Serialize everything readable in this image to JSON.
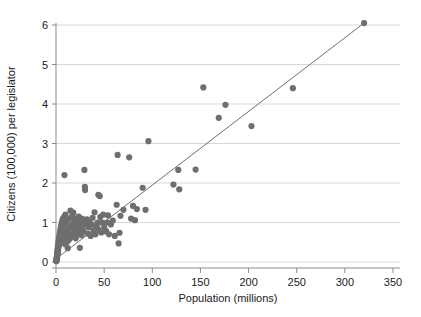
{
  "chart_data": {
    "type": "scatter",
    "title": "",
    "subtitle": "",
    "xlabel": "Population (millions)",
    "ylabel": "Citizens (100,000) per legislator",
    "xlim": [
      -8,
      358
    ],
    "ylim": [
      -0.18,
      6.35
    ],
    "xticks": [
      0,
      50,
      100,
      150,
      200,
      250,
      300,
      350
    ],
    "yticks": [
      0,
      1,
      2,
      3,
      4,
      5,
      6
    ],
    "xtick_labels": [
      "0",
      "50",
      "100",
      "150",
      "200",
      "250",
      "300",
      "350"
    ],
    "ytick_labels": [
      "0",
      "1",
      "2",
      "3",
      "4",
      "5",
      "6"
    ],
    "grid": "horizontal",
    "legend": "none",
    "annotations": [],
    "colors": {
      "marker": "#6e6e6e",
      "fit_line": "#6e6e6e",
      "gridline": "#d8d8d8",
      "axis": "#8a8a8a",
      "text": "#1a1a1a",
      "background": "#ffffff"
    },
    "marker_size_px": 3.1,
    "series": [
      {
        "name": "Countries",
        "type": "scatter",
        "points": [
          [
            0.3,
            0.02
          ],
          [
            0.4,
            0.05
          ],
          [
            0.5,
            0.03
          ],
          [
            0.6,
            0.08
          ],
          [
            0.7,
            0.06
          ],
          [
            0.8,
            0.12
          ],
          [
            0.9,
            0.1
          ],
          [
            1.0,
            0.15
          ],
          [
            1.1,
            0.09
          ],
          [
            1.2,
            0.2
          ],
          [
            1.3,
            0.14
          ],
          [
            1.4,
            0.25
          ],
          [
            1.5,
            0.18
          ],
          [
            1.6,
            0.3
          ],
          [
            1.7,
            0.22
          ],
          [
            1.8,
            0.35
          ],
          [
            1.9,
            0.26
          ],
          [
            2.0,
            0.4
          ],
          [
            2.1,
            0.3
          ],
          [
            2.2,
            0.45
          ],
          [
            2.3,
            0.33
          ],
          [
            2.5,
            0.5
          ],
          [
            2.6,
            0.38
          ],
          [
            2.8,
            0.55
          ],
          [
            3.0,
            0.42
          ],
          [
            3.1,
            0.6
          ],
          [
            3.3,
            0.47
          ],
          [
            3.5,
            0.65
          ],
          [
            3.6,
            0.5
          ],
          [
            3.8,
            0.7
          ],
          [
            4.0,
            0.55
          ],
          [
            4.1,
            0.75
          ],
          [
            4.3,
            0.58
          ],
          [
            4.5,
            0.8
          ],
          [
            4.7,
            0.62
          ],
          [
            4.9,
            0.85
          ],
          [
            5.1,
            0.66
          ],
          [
            5.3,
            0.9
          ],
          [
            5.5,
            0.7
          ],
          [
            5.7,
            0.95
          ],
          [
            5.9,
            0.74
          ],
          [
            6.1,
            1.0
          ],
          [
            6.3,
            0.78
          ],
          [
            6.6,
            1.05
          ],
          [
            6.9,
            0.82
          ],
          [
            7.2,
            1.1
          ],
          [
            7.4,
            0.86
          ],
          [
            7.7,
            0.55
          ],
          [
            8.0,
            0.9
          ],
          [
            8.3,
            0.6
          ],
          [
            8.6,
            1.15
          ],
          [
            8.9,
            0.65
          ],
          [
            9.2,
            0.95
          ],
          [
            9.5,
            0.45
          ],
          [
            9.8,
            1.2
          ],
          [
            8.8,
            2.2
          ],
          [
            10.2,
            0.7
          ],
          [
            10.6,
            1.0
          ],
          [
            11.0,
            0.5
          ],
          [
            11.4,
            0.75
          ],
          [
            11.8,
            1.05
          ],
          [
            12.2,
            0.35
          ],
          [
            12.6,
            0.8
          ],
          [
            13.0,
            0.55
          ],
          [
            13.5,
            1.1
          ],
          [
            14.0,
            0.85
          ],
          [
            14.5,
            0.6
          ],
          [
            15.0,
            1.3
          ],
          [
            15.5,
            0.9
          ],
          [
            16.0,
            0.65
          ],
          [
            16.5,
            1.15
          ],
          [
            17.0,
            0.95
          ],
          [
            17.5,
            0.7
          ],
          [
            18.0,
            1.25
          ],
          [
            18.5,
            1.0
          ],
          [
            19.0,
            0.75
          ],
          [
            19.5,
            1.05
          ],
          [
            20.0,
            0.85
          ],
          [
            20.5,
            0.6
          ],
          [
            21.0,
            1.1
          ],
          [
            21.5,
            0.9
          ],
          [
            22.0,
            0.7
          ],
          [
            22.5,
            1.0
          ],
          [
            23.0,
            0.8
          ],
          [
            23.5,
            1.15
          ],
          [
            24.0,
            0.95
          ],
          [
            24.5,
            0.75
          ],
          [
            25.0,
            1.05
          ],
          [
            25.5,
            0.85
          ],
          [
            26.0,
            1.0
          ],
          [
            26.5,
            0.68
          ],
          [
            27.0,
            1.1
          ],
          [
            27.5,
            0.88
          ],
          [
            28.0,
            0.98
          ],
          [
            28.5,
            0.78
          ],
          [
            24.8,
            0.36
          ],
          [
            29.5,
            2.33
          ],
          [
            29.0,
            1.02
          ],
          [
            30.0,
            1.9
          ],
          [
            30.2,
            1.82
          ],
          [
            31.0,
            0.95
          ],
          [
            32.0,
            1.08
          ],
          [
            33.0,
            0.72
          ],
          [
            34.0,
            0.88
          ],
          [
            35.0,
            1.0
          ],
          [
            36.0,
            0.66
          ],
          [
            37.0,
            0.95
          ],
          [
            38.0,
            1.12
          ],
          [
            39.0,
            0.8
          ],
          [
            40.0,
            1.26
          ],
          [
            41.0,
            0.7
          ],
          [
            42.0,
            0.9
          ],
          [
            43.0,
            1.0
          ],
          [
            44.0,
            1.7
          ],
          [
            45.5,
            1.67
          ],
          [
            44.0,
            0.82
          ],
          [
            46.0,
            1.14
          ],
          [
            47.0,
            0.75
          ],
          [
            48.0,
            1.0
          ],
          [
            49.0,
            1.2
          ],
          [
            50.0,
            0.88
          ],
          [
            51.0,
            0.78
          ],
          [
            52.0,
            0.78
          ],
          [
            53.0,
            1.0
          ],
          [
            54.0,
            1.18
          ],
          [
            55.0,
            0.7
          ],
          [
            57.0,
            0.95
          ],
          [
            59.0,
            1.05
          ],
          [
            61.0,
            0.66
          ],
          [
            63.0,
            1.45
          ],
          [
            64.0,
            2.71
          ],
          [
            66.0,
            0.74
          ],
          [
            65.0,
            0.47
          ],
          [
            67.0,
            1.17
          ],
          [
            70.0,
            1.32
          ],
          [
            76.0,
            2.65
          ],
          [
            78.0,
            1.1
          ],
          [
            80.0,
            1.42
          ],
          [
            82.0,
            1.06
          ],
          [
            84.0,
            1.34
          ],
          [
            90.0,
            1.88
          ],
          [
            96.0,
            3.06
          ],
          [
            93.0,
            1.32
          ],
          [
            122.0,
            1.96
          ],
          [
            128.0,
            1.84
          ],
          [
            127.0,
            2.33
          ],
          [
            145.0,
            2.34
          ],
          [
            153.0,
            4.42
          ],
          [
            169.0,
            3.65
          ],
          [
            176.0,
            3.98
          ],
          [
            203.0,
            3.44
          ],
          [
            246.0,
            4.4
          ],
          [
            320.0,
            6.05
          ]
        ]
      }
    ],
    "fit_line": {
      "name": "Linear fit",
      "type": "line",
      "x0": 0,
      "y0": 0.08,
      "x1": 320,
      "y1": 6.05
    }
  }
}
